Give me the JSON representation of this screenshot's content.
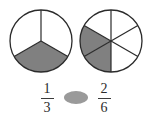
{
  "page": {
    "background_color": "#ffffff"
  },
  "colors": {
    "shaded": "#808080",
    "unshaded": "#ffffff",
    "stroke": "#2b2b2b",
    "blank_oval": "#9a9a9a",
    "text": "#2b2b2b"
  },
  "models": [
    {
      "name": "left-pie",
      "label": "one third shaded",
      "total_parts": 3,
      "shaded_parts": 1,
      "shaded_indices": [
        1
      ],
      "center": {
        "cx": 32,
        "cy": 32
      },
      "radius": 31,
      "start_angle_deg": -90
    },
    {
      "name": "right-pie",
      "label": "two sixths shaded",
      "total_parts": 6,
      "shaded_parts": 2,
      "shaded_indices": [
        3,
        4
      ],
      "center": {
        "cx": 32,
        "cy": 32
      },
      "radius": 31,
      "start_angle_deg": -90
    }
  ],
  "comparison": {
    "left_fraction": {
      "numerator": "1",
      "denominator": "3"
    },
    "operator_blank": {
      "kind": "oval-placeholder",
      "value": ""
    },
    "right_fraction": {
      "numerator": "2",
      "denominator": "6"
    }
  }
}
